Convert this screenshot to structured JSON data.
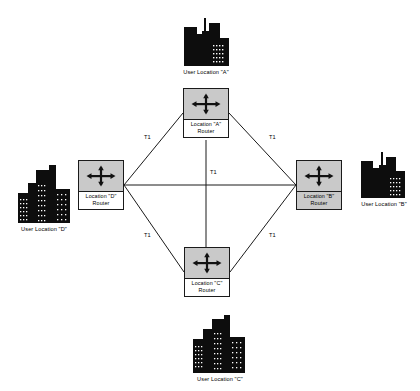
{
  "diagram": {
    "background_color": "#ffffff",
    "line_color": "#1a1a1a",
    "router_fill_color": "#c9c9c9",
    "building_color": "#0d0d0d"
  },
  "routers": [
    {
      "id": "A",
      "name_line1": "Location \"A\"",
      "name_line2": "Router",
      "icon": "router-four-way-arrow-icon",
      "x": 183,
      "y": 88,
      "label_bg": "white"
    },
    {
      "id": "B",
      "name_line1": "Location \"B\"",
      "name_line2": "Router",
      "icon": "router-four-way-arrow-icon",
      "x": 296,
      "y": 160,
      "label_bg": "gray"
    },
    {
      "id": "C",
      "name_line1": "Location \"C\"",
      "name_line2": "Router",
      "icon": "router-four-way-arrow-icon",
      "x": 184,
      "y": 247,
      "label_bg": "white"
    },
    {
      "id": "D",
      "name_line1": "Location \"D\"",
      "name_line2": "Router",
      "icon": "router-four-way-arrow-icon",
      "x": 78,
      "y": 160,
      "label_bg": "white"
    }
  ],
  "sites": [
    {
      "id": "A",
      "label": "User Location \"A\"",
      "icon": "city-skyline-icon",
      "skyline": "a"
    },
    {
      "id": "B",
      "label": "User Location \"B\"",
      "icon": "city-skyline-icon",
      "skyline": "b"
    },
    {
      "id": "C",
      "label": "User Location \"C\"",
      "icon": "city-skyline-icon",
      "skyline": "c"
    },
    {
      "id": "D",
      "label": "User Location \"D\"",
      "icon": "city-skyline-icon",
      "skyline": "d"
    }
  ],
  "links": [
    {
      "id": "da",
      "from": "D",
      "to": "A",
      "label": "T1"
    },
    {
      "id": "ab",
      "from": "A",
      "to": "B",
      "label": "T1"
    },
    {
      "id": "db",
      "from": "D",
      "to": "B",
      "label": "T1"
    },
    {
      "id": "ac",
      "from": "A",
      "to": "C",
      "label": "T1"
    },
    {
      "id": "dc",
      "from": "D",
      "to": "C",
      "label": "T1"
    },
    {
      "id": "cb",
      "from": "C",
      "to": "B",
      "label": "T1"
    }
  ]
}
